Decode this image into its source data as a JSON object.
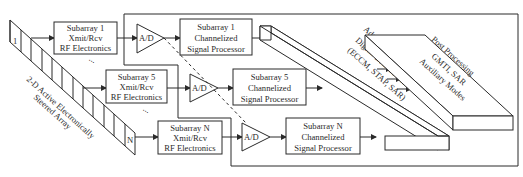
{
  "diagram": {
    "array": {
      "label_line1": "2-D Active Electronically",
      "label_line2": "Steered Array",
      "first_element": "1",
      "last_element": "N"
    },
    "rf_blocks": [
      {
        "line1": "Subarray 1",
        "line2": "Xmit/Rcv",
        "line3": "RF Electronics"
      },
      {
        "line1": "Subarray 5",
        "line2": "Xmit/Rcv",
        "line3": "RF Electronics"
      },
      {
        "line1": "Subarray N",
        "line2": "Xmit/Rcv",
        "line3": "RF Electronics"
      }
    ],
    "ad_blocks": [
      {
        "label": "A/D"
      },
      {
        "label": "A/D"
      },
      {
        "label": "A/D"
      }
    ],
    "processor_blocks": [
      {
        "line1": "Subarray 1",
        "line2": "Channelized",
        "line3": "Signal Processor"
      },
      {
        "line1": "Subarray 5",
        "line2": "Channelized",
        "line3": "Signal Processor"
      },
      {
        "line1": "Subarray N",
        "line2": "Channelized",
        "line3": "Signal Processor"
      }
    ],
    "beamformer": {
      "line1": "Adaptive/Programmable",
      "line2": "Digital Beamformer",
      "line3": "(ECCM, STAP, SAR)"
    },
    "post_processing": {
      "line1": "Post Processing",
      "line2": "GMTI, SAR",
      "line3": "Auxiliary Modes"
    },
    "ellipsis": "..."
  }
}
